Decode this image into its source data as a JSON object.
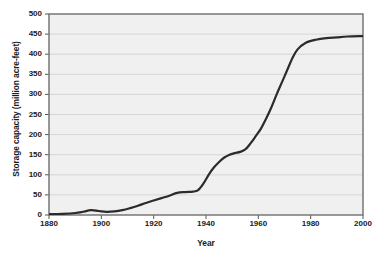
{
  "chart_data": {
    "type": "line",
    "title": "",
    "xlabel": "Year",
    "ylabel": "Storage capacity (million acre-feet)",
    "xlim": [
      1880,
      2000
    ],
    "ylim": [
      0,
      500
    ],
    "xticks": [
      1880,
      1900,
      1920,
      1940,
      1960,
      1980,
      2000
    ],
    "xticklabels": [
      "1880",
      "1900",
      "1920",
      "1940",
      "1960",
      "1980",
      "2000"
    ],
    "yticks": [
      0,
      50,
      100,
      150,
      200,
      250,
      300,
      350,
      400,
      450,
      500
    ],
    "yticklabels": [
      "0",
      "50",
      "100",
      "150",
      "200",
      "250",
      "300",
      "350",
      "400",
      "450",
      "500"
    ],
    "grid": "horizontal",
    "legend": "none",
    "series": [
      {
        "name": "Reservoir storage capacity",
        "x": [
          1880,
          1885,
          1890,
          1893,
          1896,
          1899,
          1902,
          1905,
          1908,
          1911,
          1914,
          1917,
          1920,
          1923,
          1926,
          1929,
          1932,
          1935,
          1937,
          1939,
          1941,
          1943,
          1945,
          1947,
          1949,
          1951,
          1953,
          1955,
          1957,
          1959,
          1961,
          1963,
          1965,
          1967,
          1969,
          1971,
          1973,
          1975,
          1978,
          1982,
          1986,
          1990,
          1994,
          2000
        ],
        "values": [
          2,
          3,
          5,
          8,
          12,
          10,
          8,
          9,
          12,
          17,
          23,
          30,
          36,
          42,
          48,
          55,
          57,
          58,
          62,
          78,
          100,
          118,
          132,
          143,
          150,
          154,
          157,
          163,
          178,
          196,
          215,
          240,
          268,
          300,
          330,
          360,
          390,
          412,
          428,
          436,
          440,
          442,
          444,
          445
        ]
      }
    ],
    "line_color": "#2b2b2b",
    "plot_background": "#f0f0f0",
    "grid_color": "#cfcfcf",
    "axis_color": "#555555"
  }
}
